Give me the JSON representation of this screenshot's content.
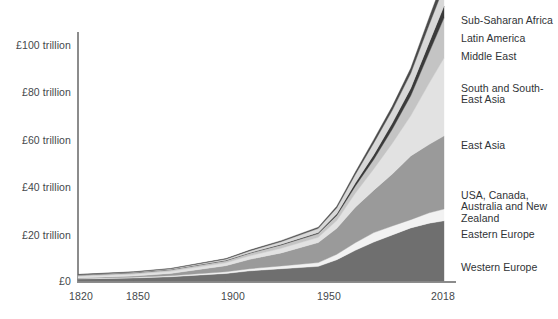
{
  "chart_data": {
    "type": "area",
    "title": "",
    "subtitle": "",
    "xlabel": "",
    "ylabel": "",
    "stacked": true,
    "grid": false,
    "legend_position": "right-outside",
    "axis": {
      "x_ticks": [
        "1820",
        "1850",
        "1900",
        "1950",
        "2018"
      ],
      "x_tick_values": [
        1820,
        1850,
        1900,
        1950,
        2018
      ],
      "xlim": [
        1820,
        2018
      ],
      "y_ticks": [
        "£0",
        "£20 trillion",
        "£40 trillion",
        "£60 trillion",
        "£80 trillion",
        "£100 trillion"
      ],
      "y_tick_values": [
        0,
        20,
        40,
        60,
        80,
        100
      ],
      "ylim": [
        0,
        112
      ],
      "y_unit": "£ trillion"
    },
    "x": [
      1820,
      1850,
      1870,
      1900,
      1913,
      1930,
      1950,
      1960,
      1970,
      1980,
      1990,
      2000,
      2010,
      2018
    ],
    "series": [
      {
        "name": "Western Europe",
        "color": "#6f6f6f",
        "values": [
          0.9,
          1.3,
          1.8,
          3.2,
          4.3,
          5.2,
          6.2,
          9.0,
          13.0,
          16.5,
          19.5,
          22.5,
          24.5,
          25.5
        ]
      },
      {
        "name": "Eastern Europe",
        "color": "#f2f2f2",
        "values": [
          0.2,
          0.3,
          0.4,
          0.7,
          0.9,
          1.2,
          1.6,
          2.3,
          3.2,
          4.0,
          3.8,
          3.5,
          4.4,
          5.0
        ]
      },
      {
        "name": "USA, Canada, Australia and New Zealand",
        "color": "#9a9a9a",
        "values": [
          0.2,
          0.5,
          1.0,
          2.6,
          4.0,
          5.5,
          8.5,
          11.0,
          15.0,
          18.0,
          22.0,
          27.0,
          29.0,
          31.0
        ]
      },
      {
        "name": "East Asia",
        "color": "#e2e2e2",
        "values": [
          0.7,
          0.8,
          0.9,
          1.2,
          1.5,
          2.0,
          2.2,
          3.3,
          6.0,
          9.0,
          13.0,
          17.0,
          26.0,
          33.0
        ]
      },
      {
        "name": "South and South-East Asia",
        "color": "#c4c4c4",
        "values": [
          0.5,
          0.6,
          0.7,
          0.9,
          1.1,
          1.4,
          1.6,
          2.2,
          3.0,
          4.0,
          6.0,
          8.5,
          13.0,
          17.0
        ]
      },
      {
        "name": "Middle East",
        "color": "#3a3a3a",
        "values": [
          0.1,
          0.1,
          0.1,
          0.2,
          0.2,
          0.3,
          0.4,
          0.7,
          1.3,
          2.0,
          2.6,
          3.2,
          4.2,
          5.0
        ]
      },
      {
        "name": "Latin America",
        "color": "#d8d8d8",
        "values": [
          0.1,
          0.2,
          0.3,
          0.5,
          0.8,
          1.1,
          1.8,
          2.5,
          3.6,
          5.0,
          5.4,
          6.3,
          7.6,
          8.2
        ]
      },
      {
        "name": "Sub-Saharan Africa",
        "color": "#4a4a4a",
        "values": [
          0.1,
          0.1,
          0.1,
          0.2,
          0.3,
          0.4,
          0.5,
          0.7,
          1.0,
          1.4,
          1.7,
          2.1,
          3.0,
          3.8
        ]
      }
    ],
    "legend_entries": [
      {
        "label": "Sub-Saharan Africa",
        "color": "#4a4a4a"
      },
      {
        "label": "Latin America",
        "color": "#d8d8d8"
      },
      {
        "label": "Middle East",
        "color": "#3a3a3a"
      },
      {
        "label": "South and South-\nEast Asia",
        "color": "#c4c4c4"
      },
      {
        "label": "East Asia",
        "color": "#e2e2e2"
      },
      {
        "label": "USA, Canada,\nAustralia and New\nZealand",
        "color": "#9a9a9a"
      },
      {
        "label": "Eastern Europe",
        "color": "#f2f2f2"
      },
      {
        "label": "Western Europe",
        "color": "#6f6f6f"
      }
    ]
  },
  "colors": {
    "axis": "#8c8c8c",
    "text": "#44484b",
    "background": "#ffffff"
  }
}
